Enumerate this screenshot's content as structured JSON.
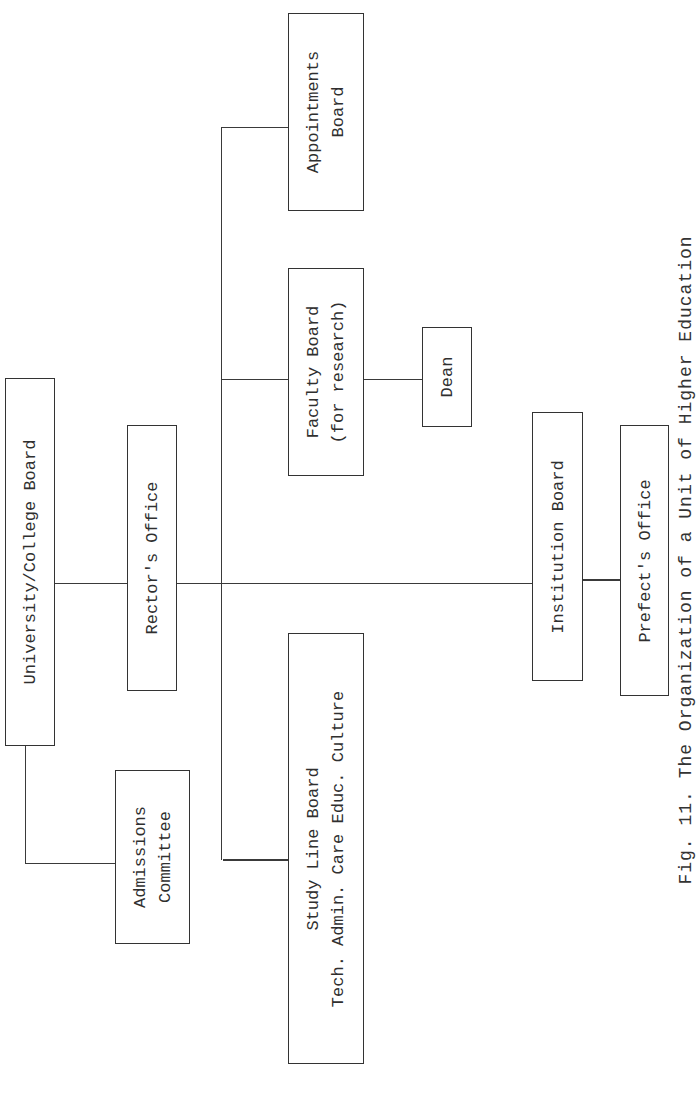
{
  "diagram": {
    "orientation": "rotated 90deg counter-clockwise (text reads bottom-to-top)",
    "nodes": {
      "university_board": {
        "lines": [
          "University/College Board"
        ]
      },
      "rectors_office": {
        "lines": [
          "Rector's Office"
        ]
      },
      "admissions_committee": {
        "lines": [
          "Admissions",
          "Committee"
        ]
      },
      "study_line_board": {
        "lines": [
          "Study Line Board",
          "Tech. Admin. Care Educ. Culture"
        ]
      },
      "faculty_board": {
        "lines": [
          "Faculty Board",
          "(for research)"
        ]
      },
      "appointments_board": {
        "lines": [
          "Appointments",
          "Board"
        ]
      },
      "dean": {
        "lines": [
          "Dean"
        ]
      },
      "institution_board": {
        "lines": [
          "Institution Board"
        ]
      },
      "prefects_office": {
        "lines": [
          "Prefect's Office"
        ]
      }
    },
    "edges": [
      [
        "University/College Board",
        "Rector's Office"
      ],
      [
        "University/College Board",
        "Admissions Committee"
      ],
      [
        "Rector's Office",
        "Study Line Board"
      ],
      [
        "Rector's Office",
        "Faculty Board (for research)"
      ],
      [
        "Rector's Office",
        "Appointments Board"
      ],
      [
        "Rector's Office",
        "Institution Board"
      ],
      [
        "Faculty Board (for research)",
        "Dean"
      ],
      [
        "Institution Board",
        "Prefect's Office"
      ]
    ],
    "caption": "Fig. 11. The Organization of a Unit of Higher Education"
  }
}
